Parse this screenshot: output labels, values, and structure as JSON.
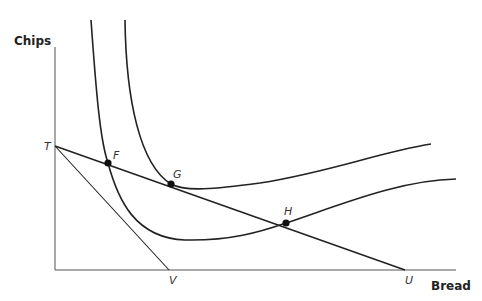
{
  "diagram": {
    "type": "indifference-curve-budget-constraint",
    "axes": {
      "x_label": "Bread",
      "y_label": "Chips"
    },
    "points": {
      "T": "T",
      "U": "U",
      "V": "V",
      "F": "F",
      "G": "G",
      "H": "H"
    },
    "budget_lines": [
      {
        "name": "TU",
        "from": "T",
        "to": "U"
      },
      {
        "name": "TV",
        "from": "T",
        "to": "V"
      }
    ],
    "indifference_curves": [
      {
        "name": "lower",
        "passes_through": [
          "F",
          "H"
        ]
      },
      {
        "name": "upper",
        "passes_through": [
          "G"
        ]
      }
    ],
    "colors": {
      "line": "#222222",
      "axis": "#555555",
      "background": "#ffffff"
    }
  }
}
